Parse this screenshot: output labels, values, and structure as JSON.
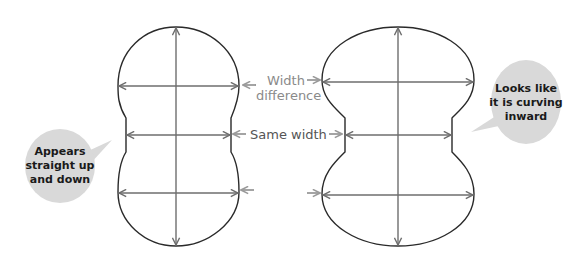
{
  "diagram": {
    "labels": {
      "width_difference_line1": "Width",
      "width_difference_line2": "difference",
      "same_width": "Same width"
    },
    "callouts": {
      "left": [
        "Appears",
        "straight up",
        "and down"
      ],
      "right": [
        "Looks like",
        "it is curving",
        "inward"
      ]
    },
    "colors": {
      "outline": "#2a2a2a",
      "arrow": "#6e6e6e",
      "label": "#8a8a8a",
      "bubble": "#d9d9d9",
      "bubble_text": "#1a1a1a"
    }
  }
}
